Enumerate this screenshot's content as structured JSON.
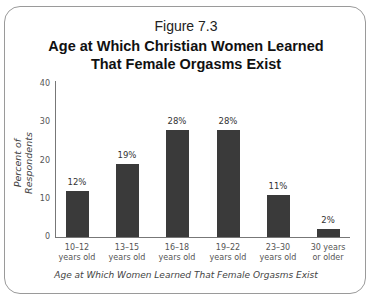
{
  "figure": {
    "number": "Figure 7.3",
    "title_line1": "Age at Which Christian Women Learned",
    "title_line2": "That Female Orgasms Exist"
  },
  "chart_data": {
    "type": "bar",
    "title": "Age at Which Christian Women Learned That Female Orgasms Exist",
    "subtitle": "Figure 7.3",
    "xlabel": "Age at Which Women Learned That Female Orgasms Exist",
    "ylabel": "Percent of Respondents",
    "ylim": [
      0,
      40
    ],
    "yticks": [
      "0",
      "10",
      "20",
      "30",
      "40"
    ],
    "grid": false,
    "legend": null,
    "categories": [
      "10–12 years old",
      "13–15 years old",
      "16–18 years old",
      "19–22 years old",
      "23–30 years old",
      "30 years or older"
    ],
    "category_lines": [
      [
        "10–12",
        "years old"
      ],
      [
        "13–15",
        "years old"
      ],
      [
        "16–18",
        "years old"
      ],
      [
        "19–22",
        "years old"
      ],
      [
        "23–30",
        "years old"
      ],
      [
        "30 years",
        "or older"
      ]
    ],
    "values": [
      12,
      19,
      28,
      28,
      11,
      2
    ],
    "value_labels": [
      "12%",
      "19%",
      "28%",
      "28%",
      "11%",
      "2%"
    ],
    "bar_color": "#3a3a3a"
  }
}
